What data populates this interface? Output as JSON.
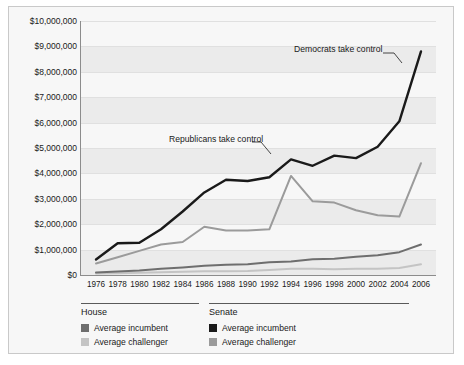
{
  "chart_data": {
    "type": "line",
    "title": "",
    "xlabel": "",
    "ylabel": "",
    "x": [
      1976,
      1978,
      1980,
      1982,
      1984,
      1986,
      1988,
      1990,
      1992,
      1994,
      1996,
      1998,
      2000,
      2002,
      2004,
      2006
    ],
    "xticklabels": [
      "1976",
      "1978",
      "1980",
      "1982",
      "1984",
      "1986",
      "1988",
      "1990",
      "1992",
      "1994",
      "1996",
      "1998",
      "2000",
      "2002",
      "2004",
      "2006"
    ],
    "ylim": [
      0,
      10000000
    ],
    "yticks": [
      0,
      1000000,
      2000000,
      3000000,
      4000000,
      5000000,
      6000000,
      7000000,
      8000000,
      9000000,
      10000000
    ],
    "yticklabels": [
      "$0",
      "$1,000,000",
      "$2,000,000",
      "$3,000,000",
      "$4,000,000",
      "$5,000,000",
      "$6,000,000",
      "$7,000,000",
      "$8,000,000",
      "$9,000,000",
      "$10,000,000"
    ],
    "grid": "horizontal-banded",
    "legend_position": "below-axes",
    "series": [
      {
        "name": "Senate average incumbent",
        "group": "Senate",
        "role": "Average incumbent",
        "color": "#1a1a1a",
        "values": [
          610000,
          1250000,
          1270000,
          1800000,
          2500000,
          3250000,
          3750000,
          3700000,
          3850000,
          4550000,
          4300000,
          4700000,
          4600000,
          5050000,
          6050000,
          8800000
        ]
      },
      {
        "name": "Senate average challenger",
        "group": "Senate",
        "role": "Average challenger",
        "color": "#9b9b9b",
        "values": [
          450000,
          700000,
          950000,
          1200000,
          1300000,
          1900000,
          1750000,
          1750000,
          1800000,
          3900000,
          2900000,
          2850000,
          2550000,
          2350000,
          2300000,
          4400000
        ]
      },
      {
        "name": "House average incumbent",
        "group": "House",
        "role": "Average incumbent",
        "color": "#6e6e6e",
        "values": [
          100000,
          140000,
          180000,
          250000,
          300000,
          360000,
          400000,
          420000,
          500000,
          530000,
          620000,
          640000,
          720000,
          780000,
          900000,
          1200000
        ]
      },
      {
        "name": "House average challenger",
        "group": "House",
        "role": "Average challenger",
        "color": "#c4c4c4",
        "values": [
          55000,
          70000,
          90000,
          110000,
          130000,
          150000,
          150000,
          160000,
          200000,
          250000,
          250000,
          230000,
          250000,
          250000,
          280000,
          420000
        ]
      }
    ],
    "annotations": [
      {
        "text": "Democrats take control",
        "target_x": 2006,
        "target_series": "Senate average incumbent"
      },
      {
        "text": "Republicans take control",
        "target_x": 1994,
        "target_series": "Senate average incumbent"
      }
    ]
  },
  "legend": {
    "house": {
      "title": "House",
      "items": [
        {
          "label": "Average incumbent",
          "color": "#6e6e6e"
        },
        {
          "label": "Average challenger",
          "color": "#c4c4c4"
        }
      ]
    },
    "senate": {
      "title": "Senate",
      "items": [
        {
          "label": "Average incumbent",
          "color": "#1a1a1a"
        },
        {
          "label": "Average challenger",
          "color": "#9b9b9b"
        }
      ]
    }
  }
}
